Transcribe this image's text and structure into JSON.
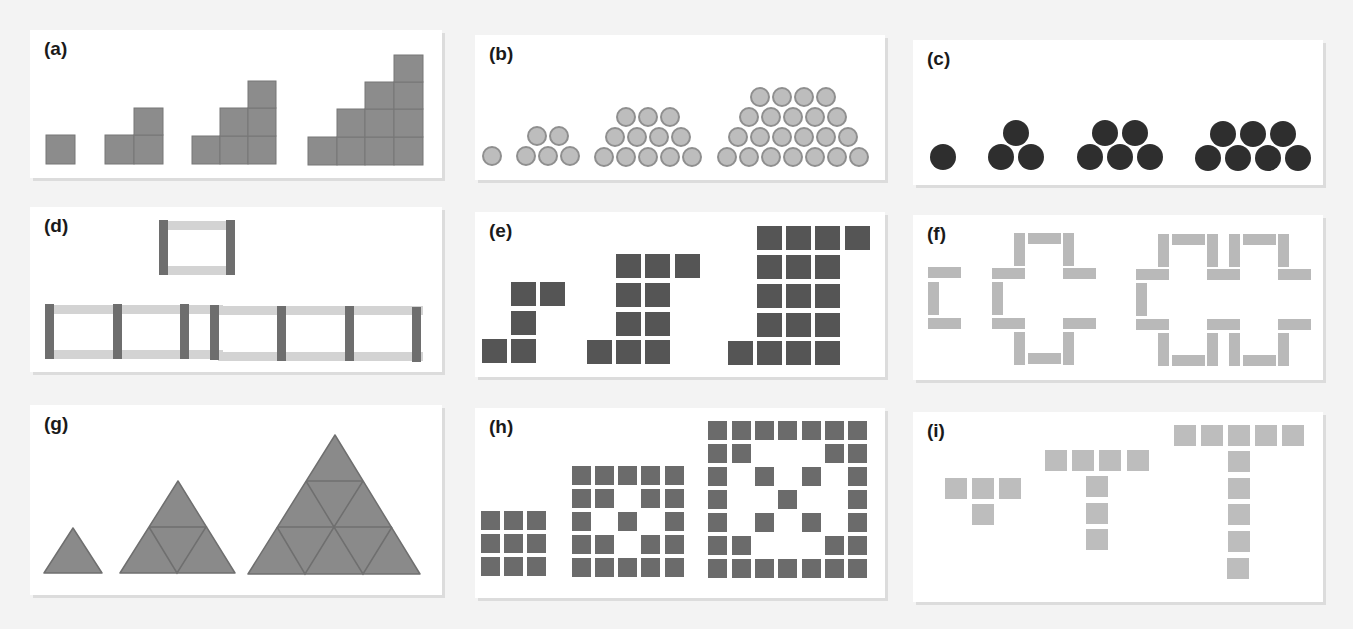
{
  "figure": {
    "panels": [
      {
        "id": "a",
        "label": "(a)",
        "shape": "square staircase",
        "stages": [
          1,
          3,
          6,
          10
        ],
        "color": "#8c8c8c"
      },
      {
        "id": "b",
        "label": "(b)",
        "shape": "light grey circle trapezoids",
        "stages": [
          1,
          5,
          12,
          22
        ],
        "color": "#bdbdbd"
      },
      {
        "id": "c",
        "label": "(c)",
        "shape": "dark circle triangles/trapezoids",
        "stages": [
          1,
          3,
          5,
          7
        ],
        "color": "#2e2e2e"
      },
      {
        "id": "d",
        "label": "(d)",
        "shape": "rectangular frames of rods",
        "stages": [
          1,
          2,
          3
        ],
        "dark_rods": [
          2,
          3,
          4
        ],
        "light_rods": [
          2,
          4,
          6
        ],
        "dark_color": "#6e6e6e",
        "light_color": "#d3d3d3"
      },
      {
        "id": "e",
        "label": "(e)",
        "shape": "dark square steps",
        "stages": [
          5,
          11,
          19
        ],
        "color": "#555555"
      },
      {
        "id": "f",
        "label": "(f)",
        "shape": "rod crosses",
        "stages": [
          3,
          12,
          21
        ],
        "color": "#b9b9b9"
      },
      {
        "id": "g",
        "label": "(g)",
        "shape": "subdivided triangles",
        "stages": [
          1,
          4,
          9
        ],
        "color": "#8a8a8a"
      },
      {
        "id": "h",
        "label": "(h)",
        "shape": "square grids with X pattern",
        "stages": [
          9,
          21,
          37
        ],
        "color": "#6b6b6b"
      },
      {
        "id": "i",
        "label": "(i)",
        "shape": "T shapes",
        "stages": [
          4,
          7,
          10
        ],
        "color": "#bdbdbd"
      }
    ]
  }
}
